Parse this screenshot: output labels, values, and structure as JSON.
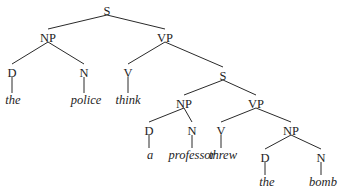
{
  "diagram": {
    "type": "syntax-tree",
    "sentence": "the police think a professor threw the bomb",
    "nodes": [
      {
        "id": "s1",
        "label": "S",
        "x": 107,
        "y": 11
      },
      {
        "id": "np1",
        "label": "NP",
        "x": 48,
        "y": 38
      },
      {
        "id": "vp1",
        "label": "VP",
        "x": 165,
        "y": 38
      },
      {
        "id": "d1",
        "label": "D",
        "x": 12,
        "y": 73
      },
      {
        "id": "n1",
        "label": "N",
        "x": 84,
        "y": 73
      },
      {
        "id": "v1",
        "label": "V",
        "x": 128,
        "y": 73
      },
      {
        "id": "s2",
        "label": "S",
        "x": 223,
        "y": 76
      },
      {
        "id": "np2",
        "label": "NP",
        "x": 184,
        "y": 104
      },
      {
        "id": "vp2",
        "label": "VP",
        "x": 256,
        "y": 104
      },
      {
        "id": "d2",
        "label": "D",
        "x": 149,
        "y": 131
      },
      {
        "id": "n2",
        "label": "N",
        "x": 192,
        "y": 131
      },
      {
        "id": "v2",
        "label": "V",
        "x": 221,
        "y": 131
      },
      {
        "id": "np3",
        "label": "NP",
        "x": 291,
        "y": 131
      },
      {
        "id": "d3",
        "label": "D",
        "x": 265,
        "y": 158
      },
      {
        "id": "n3",
        "label": "N",
        "x": 321,
        "y": 158
      }
    ],
    "words": [
      {
        "id": "w1",
        "text": "the",
        "x": 13,
        "y": 104,
        "parent": "d1"
      },
      {
        "id": "w2",
        "text": "police",
        "x": 86,
        "y": 104,
        "parent": "n1"
      },
      {
        "id": "w3",
        "text": "think",
        "x": 128,
        "y": 104,
        "parent": "v1"
      },
      {
        "id": "w4",
        "text": "a",
        "x": 150,
        "y": 159,
        "parent": "d2"
      },
      {
        "id": "w5",
        "text": "professor",
        "x": 192,
        "y": 159,
        "parent": "n2"
      },
      {
        "id": "w6",
        "text": "threw",
        "x": 223,
        "y": 159,
        "parent": "v2"
      },
      {
        "id": "w7",
        "text": "the",
        "x": 267,
        "y": 186,
        "parent": "d3"
      },
      {
        "id": "w8",
        "text": "bomb",
        "x": 323,
        "y": 186,
        "parent": "n3"
      }
    ],
    "edges": [
      [
        "s1",
        "np1"
      ],
      [
        "s1",
        "vp1"
      ],
      [
        "np1",
        "d1"
      ],
      [
        "np1",
        "n1"
      ],
      [
        "vp1",
        "v1"
      ],
      [
        "vp1",
        "s2"
      ],
      [
        "s2",
        "np2"
      ],
      [
        "s2",
        "vp2"
      ],
      [
        "np2",
        "d2"
      ],
      [
        "np2",
        "n2"
      ],
      [
        "vp2",
        "v2"
      ],
      [
        "vp2",
        "np3"
      ],
      [
        "np3",
        "d3"
      ],
      [
        "np3",
        "n3"
      ],
      [
        "d1",
        "w1"
      ],
      [
        "n1",
        "w2"
      ],
      [
        "v1",
        "w3"
      ],
      [
        "d2",
        "w4"
      ],
      [
        "n2",
        "w5"
      ],
      [
        "v2",
        "w6"
      ],
      [
        "d3",
        "w7"
      ],
      [
        "n3",
        "w8"
      ]
    ]
  }
}
